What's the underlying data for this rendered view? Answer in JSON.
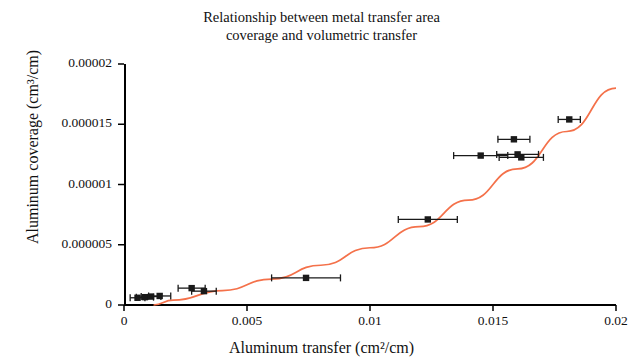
{
  "chart_data": {
    "type": "scatter",
    "title": "Relationship between metal transfer area coverage and volumetric transfer",
    "title_line1": "Relationship between metal transfer area",
    "title_line2": "coverage and volumetric transfer",
    "xlabel": "Aluminum transfer (cm²/cm)",
    "ylabel": "Aluminum coverage (cm³/cm)",
    "xlim": [
      0,
      0.02
    ],
    "ylim": [
      0,
      2e-05
    ],
    "xticks": [
      0,
      0.005,
      0.01,
      0.015,
      0.02
    ],
    "xtick_labels": [
      "0",
      "0.005",
      "0.01",
      "0.015",
      "0.02"
    ],
    "yticks": [
      0,
      5e-06,
      1e-05,
      1.5e-05,
      2e-05
    ],
    "ytick_labels": [
      "0",
      "0.000005",
      "0.00001",
      "0.000015",
      "0.00002"
    ],
    "grid": false,
    "legend": "none",
    "marker_color": "#1a1a1a",
    "curve_color": "#f4714a",
    "points": [
      {
        "x": 0.00055,
        "y": 6e-07,
        "xerr": 0.0003
      },
      {
        "x": 0.00085,
        "y": 6.5e-07,
        "xerr": 0.00035
      },
      {
        "x": 0.0011,
        "y": 7e-07,
        "xerr": 0.0004
      },
      {
        "x": 0.00145,
        "y": 7.5e-07,
        "xerr": 0.00045
      },
      {
        "x": 0.00275,
        "y": 1.4e-06,
        "xerr": 0.00055
      },
      {
        "x": 0.00325,
        "y": 1.15e-06,
        "xerr": 0.0005
      },
      {
        "x": 0.0074,
        "y": 2.25e-06,
        "xerr": 0.0014
      },
      {
        "x": 0.01235,
        "y": 7.1e-06,
        "xerr": 0.0012
      },
      {
        "x": 0.0145,
        "y": 1.24e-05,
        "xerr": 0.0011
      },
      {
        "x": 0.01585,
        "y": 1.375e-05,
        "xerr": 0.00065
      },
      {
        "x": 0.016,
        "y": 1.25e-05,
        "xerr": 0.00085
      },
      {
        "x": 0.01615,
        "y": 1.225e-05,
        "xerr": 0.0009
      },
      {
        "x": 0.0181,
        "y": 1.54e-05,
        "xerr": 0.00045
      }
    ],
    "fit_curve": {
      "description": "smooth increasing power-law style trend line",
      "points": [
        {
          "x": 0.0012,
          "y": 0.0
        },
        {
          "x": 0.002,
          "y": 4e-07
        },
        {
          "x": 0.004,
          "y": 1.2e-06
        },
        {
          "x": 0.006,
          "y": 2.15e-06
        },
        {
          "x": 0.008,
          "y": 3.3e-06
        },
        {
          "x": 0.01,
          "y": 4.75e-06
        },
        {
          "x": 0.012,
          "y": 6.5e-06
        },
        {
          "x": 0.014,
          "y": 8.7e-06
        },
        {
          "x": 0.016,
          "y": 1.13e-05
        },
        {
          "x": 0.018,
          "y": 1.44e-05
        },
        {
          "x": 0.02,
          "y": 1.8e-05
        }
      ]
    }
  }
}
